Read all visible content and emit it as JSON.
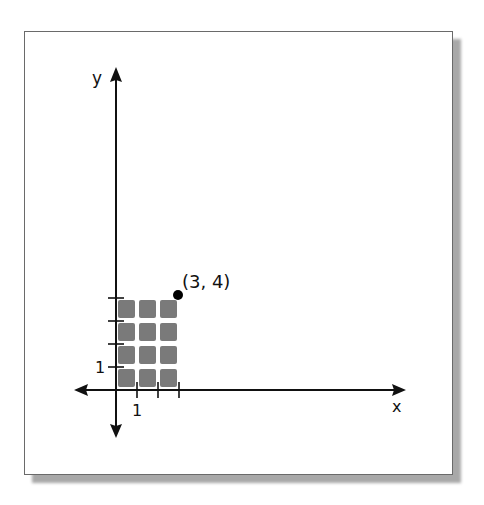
{
  "diagram": {
    "axes": {
      "x_label": "x",
      "y_label": "y",
      "x_tick_label": "1",
      "y_tick_label": "1"
    },
    "point": {
      "label": "(3, 4)",
      "x": 3,
      "y": 4
    },
    "grid": {
      "columns": 3,
      "rows": 4,
      "square_color": "#7a7a7a"
    },
    "colors": {
      "axis": "#111111",
      "frame_border": "#6a6a6a",
      "shadow": "#a8a8a8",
      "point": "#000000"
    }
  }
}
